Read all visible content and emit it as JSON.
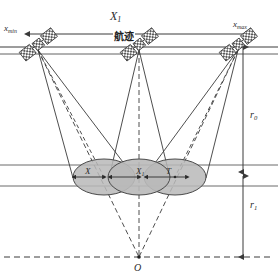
{
  "diagram": {
    "colors": {
      "line": "#3a3a3a",
      "ellipse_fill": "#b9b9b9",
      "ellipse_stroke": "#4a4a4a",
      "text": "#2b2b2b",
      "background": "#ffffff"
    },
    "labels": {
      "x_min": "x",
      "x_min_sub": "min",
      "x_max": "x",
      "x_max_sub": "max",
      "span_x": "X",
      "span_x_sub": "1",
      "track_cn": "航迹",
      "r0": "r",
      "r0_sub": "0",
      "r1": "r",
      "r1_sub": "1",
      "origin": "O",
      "footprint_x": "X",
      "footprint_x1": "X",
      "footprint_x1_sub": "1",
      "footprint_t": "T"
    },
    "satellites": [
      {
        "name": "satellite-left",
        "x": 38,
        "y": 44
      },
      {
        "name": "satellite-center",
        "x": 139,
        "y": 44
      },
      {
        "name": "satellite-right",
        "x": 238,
        "y": 44
      }
    ],
    "footprints": [
      {
        "name": "footprint-left",
        "cx": 104,
        "cy": 177,
        "rx": 31,
        "ry": 18
      },
      {
        "name": "footprint-center",
        "cx": 139,
        "cy": 177,
        "rx": 31,
        "ry": 18
      },
      {
        "name": "footprint-right",
        "cx": 175,
        "cy": 177,
        "rx": 31,
        "ry": 18
      }
    ],
    "measures": {
      "track_line_y": 47,
      "swath_top_y": 165,
      "swath_bottom_y": 186,
      "origin_y": 257,
      "r0_from": 47,
      "r0_to": 172,
      "r1_from": 176,
      "r1_to": 257
    }
  }
}
